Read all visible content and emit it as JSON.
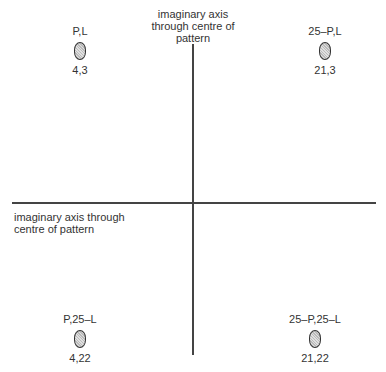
{
  "axes": {
    "vertical_label": "imaginary axis through centre of pattern",
    "horizontal_label": "imaginary axis through centre of pattern"
  },
  "markers": [
    {
      "name": "P,L",
      "coord": "4,3"
    },
    {
      "name": "25–P,L",
      "coord": "21,3"
    },
    {
      "name": "P,25–L",
      "coord": "4,22"
    },
    {
      "name": "25–P,25–L",
      "coord": "21,22"
    }
  ]
}
